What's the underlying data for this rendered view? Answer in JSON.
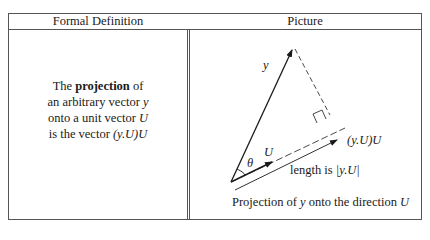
{
  "table": {
    "headers": [
      "Formal Definition",
      "Picture"
    ]
  },
  "definition": {
    "line1_pre": "The ",
    "line1_bold": "projection",
    "line1_post": " of",
    "line2_pre": "an arbitrary vector ",
    "line2_var": "y",
    "line3_pre": "onto a unit vector ",
    "line3_var": "U",
    "line4_pre": "is the vector ",
    "line4_math": "(y.U)U"
  },
  "picture": {
    "label_y": "y",
    "label_U": "U",
    "label_theta": "θ",
    "label_projection": "(y.U)U",
    "label_length_pre": "length is ",
    "label_length_math": "|y.U|",
    "caption_pre": "Projection of ",
    "caption_var1": "y",
    "caption_mid": " onto the direction ",
    "caption_var2": "U"
  }
}
